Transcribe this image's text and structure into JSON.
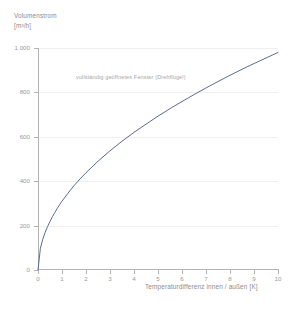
{
  "chart_data": {
    "type": "line",
    "title": "",
    "xlabel": "Temperaturdifferenz innen / außen [K]",
    "ylabel_line1": "Volumenstrom",
    "ylabel_line2": "[m³/h]",
    "annotation": "vollständig geöffnetes Fenster (Drehflügel)",
    "xlim": [
      0,
      10
    ],
    "ylim": [
      0,
      1000
    ],
    "grid": true,
    "legend_position": "none",
    "xticks": [
      "0",
      "1",
      "2",
      "3",
      "4",
      "5",
      "6",
      "7",
      "8",
      "9",
      "10"
    ],
    "xtick_values": [
      0,
      1,
      2,
      3,
      4,
      5,
      6,
      7,
      8,
      9,
      10
    ],
    "yticks": [
      "0",
      "200",
      "400",
      "600",
      "800",
      "1.000"
    ],
    "ytick_values": [
      0,
      200,
      400,
      600,
      800,
      1000
    ],
    "series": [
      {
        "name": "vollständig geöffnetes Fenster (Drehflügel)",
        "color": "#5a6b96",
        "x": [
          0,
          0.1,
          0.2,
          0.3,
          0.4,
          0.5,
          0.6,
          0.7,
          0.8,
          0.9,
          1.0,
          1.25,
          1.5,
          1.75,
          2.0,
          2.5,
          3.0,
          3.5,
          4.0,
          4.5,
          5.0,
          5.5,
          6.0,
          6.5,
          7.0,
          7.5,
          8.0,
          8.5,
          9.0,
          9.5,
          10.0
        ],
        "values": [
          0,
          98,
          139,
          170,
          196,
          219,
          240,
          259,
          277,
          294,
          310,
          346,
          380,
          410,
          438,
          490,
          537,
          580,
          620,
          657,
          693,
          727,
          759,
          790,
          820,
          849,
          877,
          904,
          930,
          955,
          980
        ]
      }
    ]
  },
  "colors": {
    "curve": "#5a6b96",
    "axis": "#b3b3b3",
    "grid": "#f0f0f0",
    "tick_text": "#9a9a9a",
    "label_text": "#8c8c8c",
    "annotation_text": "#a8a8a8",
    "background": "#ffffff"
  }
}
